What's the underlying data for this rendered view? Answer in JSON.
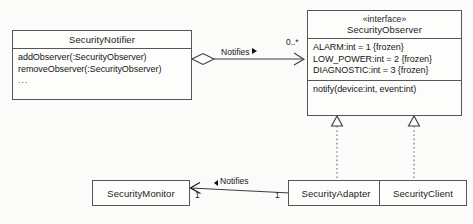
{
  "diagram": {
    "kind": "uml-class-diagram",
    "background_color": "#fbfbfa",
    "line_color": "#55565a",
    "text_color": "#151515"
  },
  "classes": [
    {
      "id": "security-notifier",
      "name": "SecurityNotifier",
      "stereotype": "",
      "members": [
        "addObserver(:SecurityObserver)",
        "removeObserver(:SecurityObserver)",
        "..."
      ]
    },
    {
      "id": "security-observer",
      "name": "SecurityObserver",
      "stereotype": "«interface»",
      "constants": [
        "ALARM:int = 1 {frozen}",
        "LOW_POWER:int = 2 {frozen}",
        "DIAGNOSTIC:int = 3 {frozen}"
      ],
      "operations": [
        "notify(device:int, event:int)"
      ]
    },
    {
      "id": "security-monitor",
      "name": "SecurityMonitor"
    },
    {
      "id": "security-adapter",
      "name": "SecurityAdapter"
    },
    {
      "id": "security-client",
      "name": "SecurityClient"
    }
  ],
  "relationships": [
    {
      "id": "notifier-observes",
      "type": "aggregation",
      "from": "SecurityNotifier",
      "to": "SecurityObserver",
      "label": "Notifies",
      "direction_marker": "▶",
      "source_multiplicity": "",
      "target_multiplicity": "0..*"
    },
    {
      "id": "adapter-realizes-observer",
      "type": "realization",
      "from": "SecurityAdapter",
      "to": "SecurityObserver",
      "label": ""
    },
    {
      "id": "client-realizes-observer",
      "type": "realization",
      "from": "SecurityClient",
      "to": "SecurityObserver",
      "label": ""
    },
    {
      "id": "adapter-notifies-monitor",
      "type": "association",
      "from": "SecurityAdapter",
      "to": "SecurityMonitor",
      "label": "Notifies",
      "direction_marker": "◀",
      "source_multiplicity": "1",
      "target_multiplicity": "1"
    }
  ]
}
